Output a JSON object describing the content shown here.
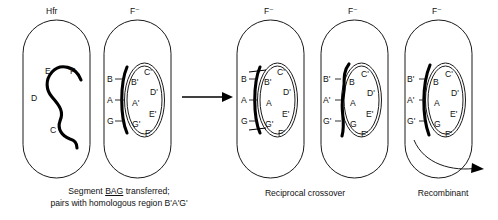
{
  "figure": {
    "background_color": "#ffffff",
    "ink_color": "#111111",
    "strand_color": "#000000"
  },
  "cells": [
    {
      "id": "cell-hfr-donor",
      "type_label": "Hfr",
      "caption_line1": "Segment BAG transferred;",
      "caption_underline": "BAG",
      "caption_line2": "pairs with homologous region B'A'G'",
      "outer_genes": [],
      "inner_genes": [],
      "strand_genes": [
        "E",
        "F",
        "D",
        "C"
      ]
    },
    {
      "id": "cell-recipient-fminus",
      "type_label": "F⁻",
      "outer_genes": [
        "B",
        "A",
        "G"
      ],
      "inner_genes": [
        "C'",
        "B'",
        "D'",
        "A'",
        "E'",
        "G'",
        "F'"
      ]
    },
    {
      "id": "cell-pairing",
      "type_label": "F⁻",
      "stage_label": "Reciprocal crossover",
      "outer_genes": [
        "B",
        "A",
        "G"
      ],
      "inner_genes": [
        "C'",
        "B'",
        "D'",
        "A",
        "E'",
        "G'",
        "F'"
      ]
    },
    {
      "id": "cell-exchanged",
      "type_label": "F⁻",
      "outer_genes": [
        "B'",
        "A'",
        "G'"
      ],
      "inner_genes": [
        "B",
        "C'",
        "D'",
        "A",
        "E'",
        "G",
        "F'"
      ]
    },
    {
      "id": "cell-recombinant",
      "type_label": "F⁻",
      "stage_label": "Recombinant",
      "outer_genes": [
        "B'",
        "A'",
        "G'"
      ],
      "inner_genes": [
        "B",
        "C'",
        "D'",
        "A",
        "E'",
        "G",
        "F'"
      ]
    }
  ],
  "labels": {
    "hfr": "Hfr",
    "f_minus": "F⁻",
    "gene_E": "E",
    "gene_F": "F",
    "gene_D": "D",
    "gene_C": "C",
    "gene_B": "B",
    "gene_A": "A",
    "gene_G": "G",
    "gene_Bp": "B'",
    "gene_Ap": "A'",
    "gene_Gp": "G'",
    "gene_Cp": "C'",
    "gene_Dp": "D'",
    "gene_Ep": "E'",
    "gene_Fp": "F'"
  },
  "captions": {
    "transfer_line1_pre": "Segment ",
    "transfer_line1_underlined": "BAG",
    "transfer_line1_post": " transferred;",
    "transfer_line2": "pairs with homologous region B'A'G'",
    "reciprocal_crossover": "Reciprocal crossover",
    "recombinant": "Recombinant"
  }
}
